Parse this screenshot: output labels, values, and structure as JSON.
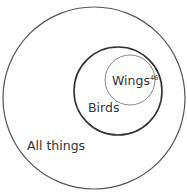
{
  "diagram": {
    "type": "nested-set-euler",
    "sets": [
      {
        "id": "all",
        "label": "All things",
        "cx": 94,
        "cy": 98,
        "r": 91,
        "stroke": "#555555",
        "stroke_width": 1.2
      },
      {
        "id": "birds",
        "label": "Birds",
        "cx": 118,
        "cy": 91,
        "r": 44,
        "stroke": "#333333",
        "stroke_width": 1.6
      },
      {
        "id": "wings",
        "label": "Wings",
        "superscript": "46",
        "cx": 130,
        "cy": 80,
        "r": 25,
        "stroke": "#888888",
        "stroke_width": 1.0
      }
    ],
    "labels": {
      "all_things": "All things",
      "birds": "Birds",
      "wings": "Wings",
      "wings_footnote": "46"
    }
  }
}
